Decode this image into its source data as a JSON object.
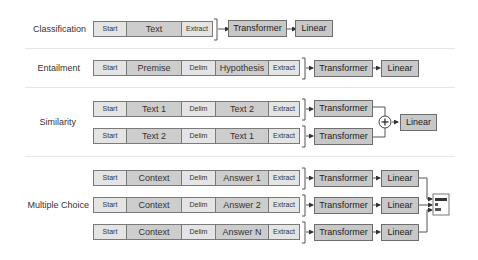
{
  "tasks": [
    {
      "label": "Classification",
      "rows": [
        {
          "tokens": [
            "Start",
            "Text",
            "Extract"
          ],
          "modules": [
            "Transformer",
            "Linear"
          ]
        }
      ]
    },
    {
      "label": "Entailment",
      "rows": [
        {
          "tokens": [
            "Start",
            "Premise",
            "Delim",
            "Hypothesis",
            "Extract"
          ],
          "modules": [
            "Transformer",
            "Linear"
          ]
        }
      ]
    },
    {
      "label": "Similarity",
      "rows": [
        {
          "tokens": [
            "Start",
            "Text 1",
            "Delim",
            "Text 2",
            "Extract"
          ],
          "modules": [
            "Transformer"
          ]
        },
        {
          "tokens": [
            "Start",
            "Text 2",
            "Delim",
            "Text 1",
            "Extract"
          ],
          "modules": [
            "Transformer"
          ]
        }
      ],
      "combine": {
        "symbol": "+",
        "output": "Linear"
      }
    },
    {
      "label": "Multiple Choice",
      "rows": [
        {
          "tokens": [
            "Start",
            "Context",
            "Delim",
            "Answer 1",
            "Extract"
          ],
          "modules": [
            "Transformer",
            "Linear"
          ]
        },
        {
          "tokens": [
            "Start",
            "Context",
            "Delim",
            "Answer 2",
            "Extract"
          ],
          "modules": [
            "Transformer",
            "Linear"
          ]
        },
        {
          "tokens": [
            "Start",
            "Context",
            "Delim",
            "Answer N",
            "Extract"
          ],
          "modules": [
            "Transformer",
            "Linear"
          ]
        }
      ],
      "combine": {
        "icon": "softmax-bars-icon"
      }
    }
  ],
  "colors": {
    "token_light": "#e4e4e4",
    "token_dark": "#cdcdcd",
    "module": "#c8c8c8",
    "border": "#7a7a7a",
    "separator": "#e6e6e6"
  }
}
